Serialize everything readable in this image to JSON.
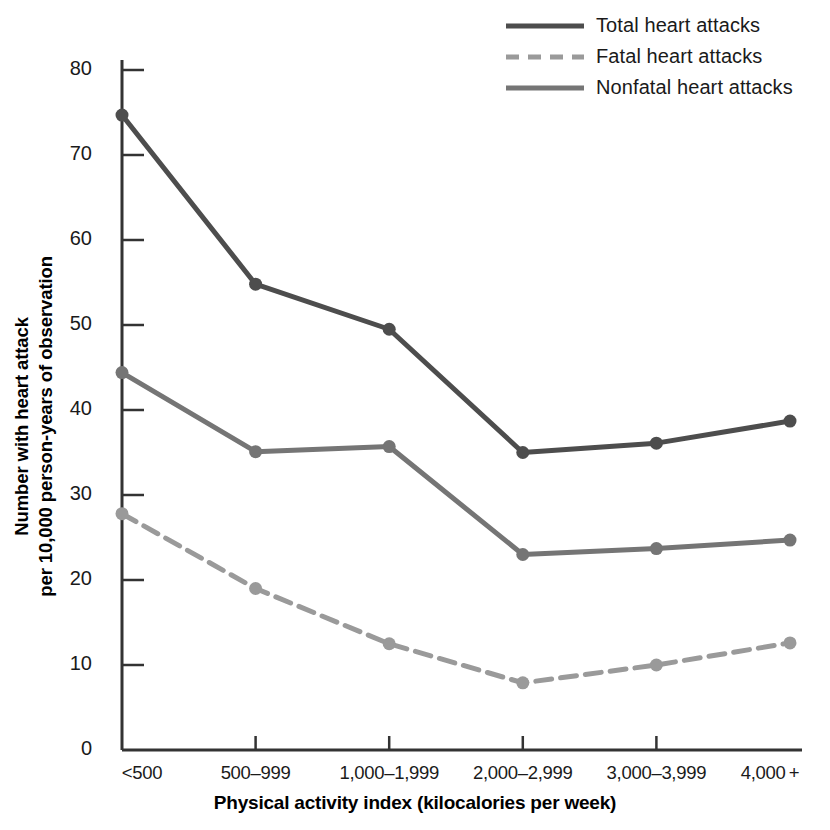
{
  "chart_data": {
    "type": "line",
    "title": "",
    "xlabel": "Physical activity index (kilocalories per week)",
    "ylabel": "Number with heart attack per 10,000 person-years of observation",
    "ylabel_lines": [
      "Number with heart attack",
      "per 10,000 person-years of observation"
    ],
    "categories": [
      "<500",
      "500–999",
      "1,000–1,999",
      "2,000–2,999",
      "3,000–3,999",
      "4,000 +"
    ],
    "ylim": [
      0,
      80
    ],
    "yticks": [
      0,
      10,
      20,
      30,
      40,
      50,
      60,
      70,
      80
    ],
    "ytick_labels": [
      "0",
      "10",
      "20",
      "30",
      "40",
      "50",
      "60",
      "70",
      "80"
    ],
    "grid": false,
    "legend_position": "top-right",
    "series": [
      {
        "name": "Total heart attacks",
        "style": "solid",
        "color": "#4d4d4d",
        "values": [
          74.7,
          54.8,
          49.5,
          35.0,
          36.1,
          38.7
        ]
      },
      {
        "name": "Fatal heart attacks",
        "style": "dashed",
        "color": "#9a9a9a",
        "values": [
          27.8,
          19.0,
          12.5,
          7.9,
          10.0,
          12.6
        ]
      },
      {
        "name": "Nonfatal heart attacks",
        "style": "solid",
        "color": "#757575",
        "values": [
          44.4,
          35.1,
          35.7,
          23.0,
          23.7,
          24.7
        ]
      }
    ]
  },
  "legend": {
    "items": [
      {
        "label": "Total heart attacks"
      },
      {
        "label": "Fatal heart attacks"
      },
      {
        "label": "Nonfatal heart attacks"
      }
    ]
  },
  "axes": {
    "y_title_line1": "Number with heart attack",
    "y_title_line2": "per 10,000 person-years of observation",
    "x_title": "Physical activity index (kilocalories per week)"
  }
}
